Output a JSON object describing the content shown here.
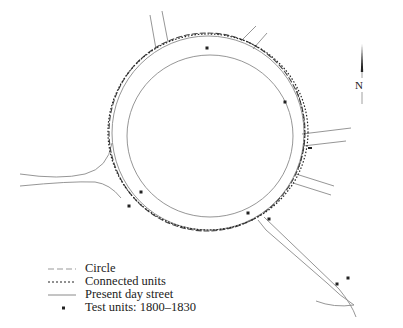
{
  "map": {
    "north_label": "N",
    "colors": {
      "street": "#8a8a8a",
      "circle": "#444444",
      "units": "#222222",
      "test_unit": "#222222"
    },
    "test_units": [
      {
        "x": 207,
        "y": 48
      },
      {
        "x": 285,
        "y": 102
      },
      {
        "x": 141,
        "y": 192
      },
      {
        "x": 129,
        "y": 206
      },
      {
        "x": 248,
        "y": 213
      },
      {
        "x": 269,
        "y": 219
      },
      {
        "x": 348,
        "y": 278
      },
      {
        "x": 337,
        "y": 284
      },
      {
        "x": 310,
        "y": 148
      }
    ]
  },
  "legend": {
    "items": [
      {
        "label": "Circle",
        "style": "dash"
      },
      {
        "label": "Connected units",
        "style": "dot"
      },
      {
        "label": "Present day street",
        "style": "solid"
      },
      {
        "label": "Test units: 1800–1830",
        "style": "square"
      }
    ]
  }
}
